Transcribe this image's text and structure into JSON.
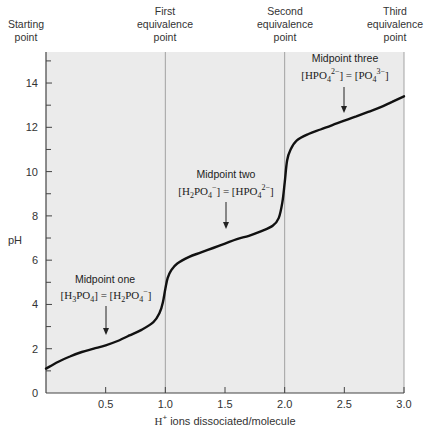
{
  "chart_data": {
    "type": "line",
    "title": "",
    "xlabel": "H+ ions dissociated/molecule",
    "ylabel": "pH",
    "xlim": [
      0,
      3.0
    ],
    "ylim": [
      0,
      15
    ],
    "x_ticks": [
      "0.5",
      "1.0",
      "1.5",
      "2.0",
      "2.5",
      "3.0"
    ],
    "y_ticks": [
      "0",
      "2",
      "4",
      "6",
      "8",
      "10",
      "12",
      "14"
    ],
    "grid": false,
    "background": "#ebebeb",
    "line_color": "#111111",
    "x": [
      0.0,
      0.1,
      0.2,
      0.3,
      0.4,
      0.5,
      0.6,
      0.7,
      0.8,
      0.9,
      0.95,
      0.98,
      1.0,
      1.02,
      1.05,
      1.1,
      1.2,
      1.3,
      1.4,
      1.5,
      1.6,
      1.7,
      1.8,
      1.9,
      1.95,
      1.98,
      2.0,
      2.02,
      2.05,
      2.1,
      2.2,
      2.3,
      2.4,
      2.5,
      2.6,
      2.7,
      2.8,
      2.9,
      3.0
    ],
    "series": [
      {
        "name": "H3PO4 titration curve",
        "values": [
          1.1,
          1.4,
          1.65,
          1.85,
          2.0,
          2.15,
          2.35,
          2.6,
          2.85,
          3.2,
          3.6,
          4.1,
          4.7,
          5.2,
          5.55,
          5.85,
          6.15,
          6.35,
          6.55,
          6.75,
          6.95,
          7.1,
          7.3,
          7.55,
          7.9,
          8.6,
          9.5,
          10.5,
          11.0,
          11.4,
          11.7,
          11.9,
          12.1,
          12.3,
          12.5,
          12.7,
          12.9,
          13.15,
          13.4
        ]
      }
    ],
    "vertical_lines": [
      0,
      1.0,
      2.0,
      3.0
    ],
    "top_labels": [
      {
        "x": 0,
        "text": [
          "Starting",
          "point"
        ]
      },
      {
        "x": 1.0,
        "text": [
          "First",
          "equivalence",
          "point"
        ]
      },
      {
        "x": 2.0,
        "text": [
          "Second",
          "equivalence",
          "point"
        ]
      },
      {
        "x": 3.0,
        "text": [
          "Third",
          "equivalence",
          "point"
        ]
      }
    ],
    "annotations": [
      {
        "x": 0.5,
        "y": 2.15,
        "title": "Midpoint one",
        "equation": "[H3PO4] = [H2PO4-]"
      },
      {
        "x": 1.5,
        "y": 6.75,
        "title": "Midpoint two",
        "equation": "[H2PO4-] = [HPO4 2-]"
      },
      {
        "x": 2.5,
        "y": 12.3,
        "title": "Midpoint three",
        "equation": "[HPO4 2-] = [PO4 3-]"
      }
    ]
  },
  "labels": {
    "starting_1": "Starting",
    "starting_2": "point",
    "first_1": "First",
    "first_2": "equivalence",
    "first_3": "point",
    "second_1": "Second",
    "second_2": "equivalence",
    "second_3": "point",
    "third_1": "Third",
    "third_2": "equivalence",
    "third_3": "point",
    "ylabel": "pH",
    "xlabel_rest": " ions dissociated/molecule",
    "xlabel_h": "H",
    "xlabel_sup": "+",
    "mid1_title": "Midpoint one",
    "mid2_title": "Midpoint two",
    "mid3_title": "Midpoint three"
  }
}
